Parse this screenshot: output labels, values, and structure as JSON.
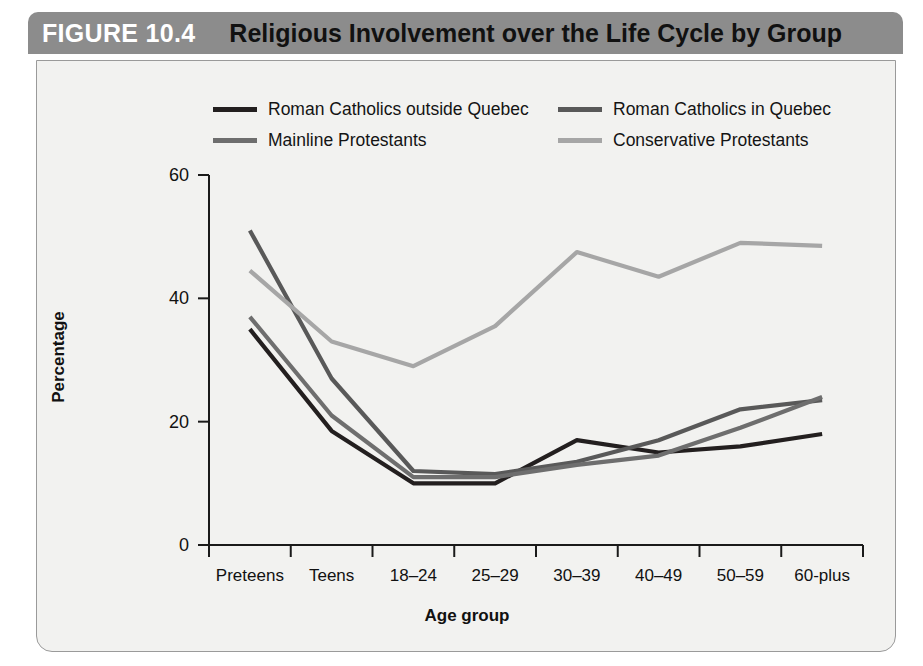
{
  "figure": {
    "number": "FIGURE 10.4",
    "title": "Religious Involvement over the Life Cycle by Group"
  },
  "colors": {
    "header_bar": "#8c8c8c",
    "panel_bg": "#f2f2f0",
    "panel_border": "#9a9a9a",
    "axis": "#1a1a1a",
    "series_roman_catholics_outside_quebec": "#231f1f",
    "series_roman_catholics_in_quebec": "#595959",
    "series_mainline_protestants": "#6e6e6e",
    "series_conservative_protestants": "#a6a6a6"
  },
  "chart_data": {
    "type": "line",
    "title": "Religious Involvement over the Life Cycle by Group",
    "xlabel": "Age group",
    "ylabel": "Percentage",
    "categories": [
      "Preteens",
      "Teens",
      "18–24",
      "25–29",
      "30–39",
      "40–49",
      "50–59",
      "60-plus"
    ],
    "ylim": [
      0,
      60
    ],
    "yticks": [
      0,
      20,
      40,
      60
    ],
    "ytick_labels": [
      "0",
      "20",
      "40",
      "60"
    ],
    "grid": false,
    "legend_position": "top",
    "series": [
      {
        "name": "Roman Catholics outside Quebec",
        "color": "#231f1f",
        "values": [
          35,
          18.5,
          10,
          10,
          17,
          15,
          16,
          18
        ]
      },
      {
        "name": "Roman Catholics in Quebec",
        "color": "#595959",
        "values": [
          51,
          27,
          12,
          11.5,
          13.5,
          17,
          22,
          23.5
        ]
      },
      {
        "name": "Mainline Protestants",
        "color": "#6e6e6e",
        "values": [
          37,
          21,
          11,
          11,
          13,
          14.5,
          19,
          24
        ]
      },
      {
        "name": "Conservative Protestants",
        "color": "#a6a6a6",
        "values": [
          44.5,
          33,
          29,
          35.5,
          47.5,
          43.5,
          49,
          48.5
        ]
      }
    ]
  },
  "legend_order": [
    0,
    1,
    2,
    3
  ]
}
